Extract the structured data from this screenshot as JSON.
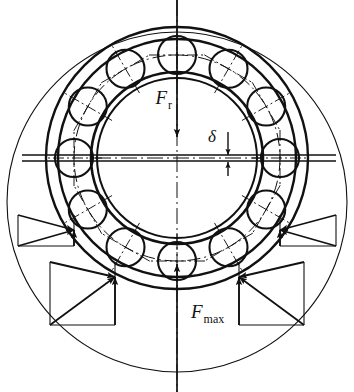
{
  "figure": {
    "kind": "engineering-diagram",
    "background_color": "#ffffff",
    "line_color": "#111111",
    "width": 354,
    "height": 392
  },
  "labels": {
    "radial_load": {
      "symbol": "F",
      "subscript": "r",
      "x": 172,
      "y": 104
    },
    "max_element_load": {
      "symbol": "F",
      "subscript": "max",
      "x": 191,
      "y": 318
    },
    "clearance": {
      "symbol": "δ",
      "x": 216,
      "y": 140
    }
  },
  "geometry": {
    "center": {
      "x": 177,
      "y": 158
    },
    "outer_ring_outer_radius": 131,
    "outer_ring_inner_radius": 119,
    "inner_ring_outer_radius": 86,
    "inner_ring_inner_radius": 80,
    "pitch_circle_radius": 103,
    "ball_radius": 19,
    "ball_count": 12,
    "ball_start_angle_deg": -90,
    "ball_step_deg": 30,
    "envelope_circle": {
      "cx": 177,
      "cy": 202,
      "r": 170
    }
  },
  "axes": {
    "vertical_centerline": {
      "x": 177,
      "y1": 0,
      "y2": 392
    },
    "horizontal_centerline": {
      "y": 158,
      "x1": 22,
      "x2": 336,
      "double_offset": 3
    }
  },
  "clearance_marker": {
    "x": 228,
    "top_y": 132,
    "bottom_y": 176,
    "gap_top_y": 155,
    "gap_bottom_y": 162
  },
  "force_arrows": {
    "radial_load_arrow": {
      "x": 177,
      "y1": 0,
      "y2": 137,
      "direction": "down"
    },
    "max_load_arrow": {
      "x": 177,
      "y1": 392,
      "y2": 264,
      "direction": "up"
    }
  },
  "contact_force_triangles": [
    {
      "name": "upper-left-contact",
      "contact": {
        "x": 74,
        "y": 230
      },
      "rect": {
        "x": 18,
        "y": 215,
        "w": 56,
        "h": 31
      },
      "origin": {
        "x": 18,
        "y": 246
      }
    },
    {
      "name": "lower-left-contact",
      "contact": {
        "x": 115,
        "y": 277
      },
      "rect": {
        "x": 50,
        "y": 262,
        "w": 65,
        "h": 63
      },
      "origin": {
        "x": 50,
        "y": 325
      }
    },
    {
      "name": "lower-right-contact",
      "contact": {
        "x": 239,
        "y": 277
      },
      "rect": {
        "x": 239,
        "y": 262,
        "w": 65,
        "h": 63
      },
      "origin": {
        "x": 304,
        "y": 325
      }
    },
    {
      "name": "upper-right-contact",
      "contact": {
        "x": 280,
        "y": 230
      },
      "rect": {
        "x": 280,
        "y": 215,
        "w": 56,
        "h": 31
      },
      "origin": {
        "x": 336,
        "y": 246
      }
    }
  ],
  "ball_angles_deg": [
    -90,
    -60,
    -30,
    0,
    30,
    60,
    90,
    120,
    150,
    180,
    210,
    240
  ]
}
